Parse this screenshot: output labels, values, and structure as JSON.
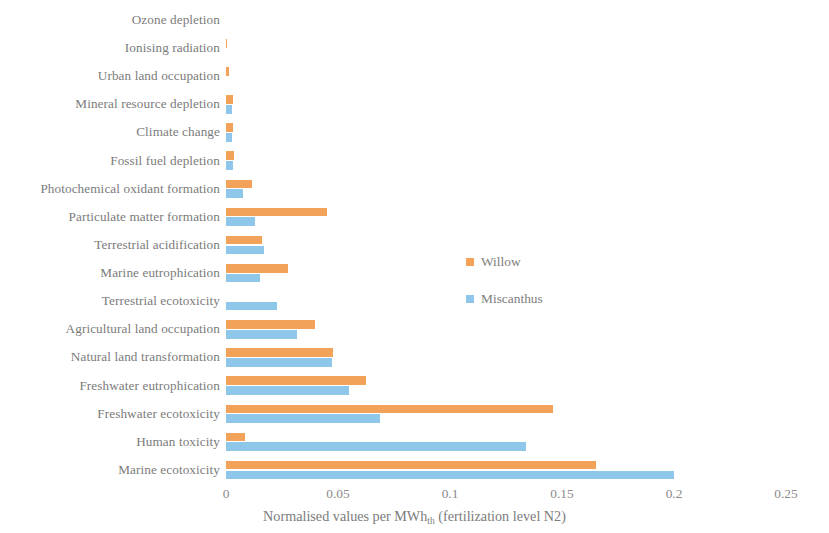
{
  "chart_data": {
    "type": "bar",
    "orientation": "horizontal",
    "title": "",
    "xlabel": "Normalised values per MWhₜₕ (fertilization level N2)",
    "xlabel_main": "Normalised values per MWh",
    "xlabel_sub": "th",
    "xlabel_tail": " (fertilization level N2)",
    "ylabel": "",
    "xlim": [
      0,
      0.25
    ],
    "grid": false,
    "legend_position": "center-right",
    "categories": [
      "Ozone depletion",
      "Ionising radiation",
      "Urban land occupation",
      "Mineral resource depletion",
      "Climate change",
      "Fossil fuel depletion",
      "Photochemical oxidant formation",
      "Particulate matter formation",
      "Terrestrial acidification",
      "Marine eutrophication",
      "Terrestrial ecotoxicity",
      "Agricultural land occupation",
      "Natural land transformation",
      "Freshwater eutrophication",
      "Freshwater ecotoxicity",
      "Human toxicity",
      "Marine ecotoxicity"
    ],
    "tick_labels": [
      "0",
      "0.05",
      "0.1",
      "0.15",
      "0.2",
      "0.25"
    ],
    "tick_values": [
      0,
      0.05,
      0.1,
      0.15,
      0.2,
      0.25
    ],
    "series": [
      {
        "name": "Willow",
        "color": "#f3a25a",
        "values": [
          0.0,
          0.0006,
          0.0013,
          0.003,
          0.0032,
          0.0036,
          0.0117,
          0.045,
          0.0161,
          0.0276,
          0.0,
          0.0399,
          0.0479,
          0.0623,
          0.1462,
          0.0085,
          0.165
        ]
      },
      {
        "name": "Miscanthus",
        "color": "#8ec7ea",
        "values": [
          0.0,
          0.0,
          0.0,
          0.0028,
          0.0029,
          0.0031,
          0.0076,
          0.013,
          0.017,
          0.0152,
          0.0229,
          0.0318,
          0.0471,
          0.0551,
          0.0686,
          0.1341,
          0.2
        ]
      }
    ]
  },
  "legend": {
    "entries": [
      {
        "label": "Willow",
        "swatch": "willow-swatch"
      },
      {
        "label": "Miscanthus",
        "swatch": "miscanthus-swatch"
      }
    ]
  }
}
